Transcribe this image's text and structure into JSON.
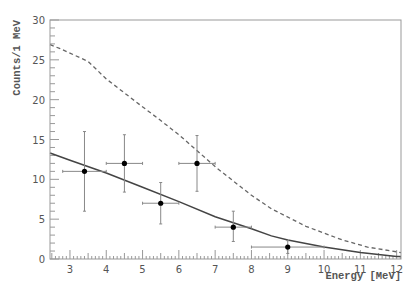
{
  "chart_data": {
    "type": "scatter",
    "title": "",
    "xlabel": "Energy [MeV]",
    "ylabel": "Counts/1 MeV",
    "xlim": [
      2.45,
      12.12
    ],
    "ylim": [
      0,
      30
    ],
    "grid": false,
    "legend": null,
    "xticks": [
      3,
      4,
      5,
      6,
      7,
      8,
      9,
      10,
      11,
      12
    ],
    "yticks": [
      0,
      5,
      10,
      15,
      20,
      25,
      30
    ],
    "series": [
      {
        "name": "data",
        "type": "points_with_errors",
        "points": [
          {
            "x": 3.4,
            "y": 11,
            "xerr": [
              2.8,
              4.0
            ],
            "yerr": [
              6.0,
              16.0
            ]
          },
          {
            "x": 4.5,
            "y": 12,
            "xerr": [
              4.0,
              5.0
            ],
            "yerr": [
              8.4,
              15.6
            ]
          },
          {
            "x": 5.5,
            "y": 7,
            "xerr": [
              5.0,
              6.0
            ],
            "yerr": [
              4.4,
              9.6
            ]
          },
          {
            "x": 6.5,
            "y": 12,
            "xerr": [
              6.0,
              7.0
            ],
            "yerr": [
              8.5,
              15.5
            ]
          },
          {
            "x": 7.5,
            "y": 4,
            "xerr": [
              7.0,
              8.0
            ],
            "yerr": [
              2.2,
              6.0
            ]
          },
          {
            "x": 9.0,
            "y": 1.5,
            "xerr": [
              8.0,
              10.0
            ],
            "yerr": [
              0.7,
              2.3
            ]
          }
        ]
      },
      {
        "name": "fit (solid)",
        "type": "line",
        "style": "solid",
        "x": [
          2.45,
          3.0,
          4.0,
          5.0,
          6.0,
          7.0,
          8.0,
          8.55,
          9.0,
          10.0,
          11.0,
          12.0,
          12.12
        ],
        "y": [
          13.3,
          12.4,
          10.8,
          9.0,
          7.2,
          5.3,
          3.8,
          2.9,
          2.4,
          1.5,
          0.8,
          0.3,
          0.3
        ]
      },
      {
        "name": "expectation (dashed)",
        "type": "line",
        "style": "dashed",
        "x": [
          2.45,
          2.73,
          3.5,
          4.0,
          4.94,
          5.41,
          6.0,
          7.05,
          8.0,
          8.55,
          9.5,
          10.5,
          11.2,
          12.0,
          12.12
        ],
        "y": [
          26.9,
          26.4,
          24.8,
          22.6,
          19.3,
          17.7,
          15.6,
          11.4,
          8.0,
          6.3,
          4.1,
          2.4,
          1.5,
          0.9,
          0.8
        ]
      }
    ]
  },
  "colors": {
    "frame": "#999999",
    "solid_line": "#444444",
    "dashed_line": "#666666",
    "points": "#000000",
    "errorbars": "#888888"
  }
}
